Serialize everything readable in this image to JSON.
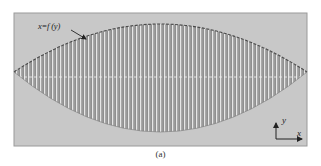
{
  "figure": {
    "caption": "(a)",
    "curve_label": "x=f (y)",
    "axis_indicator": {
      "y_label": "y",
      "x_label": "x"
    },
    "frame": {
      "left": 14,
      "top": 13,
      "right": 307,
      "bottom": 146,
      "fill": "#c8c8c8",
      "border": "#9a9a9a"
    },
    "lens": {
      "left_tip_x": 14,
      "right_tip_x": 307,
      "tip_y": 72,
      "top_y": 24,
      "bottom_y": 132,
      "stripe_period": 4,
      "fill_dark": "#8f8f8f",
      "stripe_light": "#e6e6e6",
      "midline_y": 77
    },
    "colors": {
      "background": "#ffffff",
      "text": "#222222",
      "boundary_dash": "#4a4a4a"
    }
  }
}
